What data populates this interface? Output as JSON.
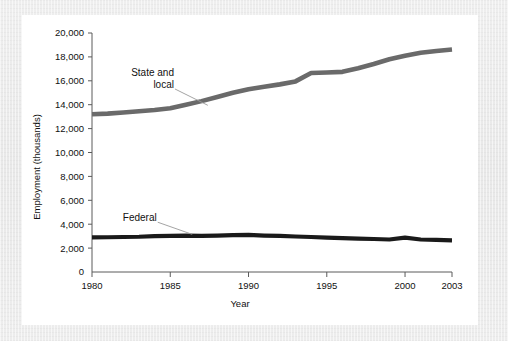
{
  "figure": {
    "background_color": "#ebebeb",
    "card_color": "#ffffff"
  },
  "chart_data": {
    "type": "line",
    "title": "",
    "xlabel": "Year",
    "ylabel": "Employment (thousands)",
    "xlim": [
      1980,
      2003
    ],
    "ylim": [
      0,
      20000
    ],
    "xticks": [
      "1980",
      "1985",
      "1990",
      "1995",
      "2000",
      "2003"
    ],
    "xtick_values": [
      1980,
      1985,
      1990,
      1995,
      2000,
      2003
    ],
    "yticks": [
      "0",
      "2,000",
      "4,000",
      "6,000",
      "8,000",
      "10,000",
      "12,000",
      "14,000",
      "16,000",
      "18,000",
      "20,000"
    ],
    "ytick_values": [
      0,
      2000,
      4000,
      6000,
      8000,
      10000,
      12000,
      14000,
      16000,
      18000,
      20000
    ],
    "grid": false,
    "legend": "inline-annotations",
    "x": [
      1980,
      1981,
      1982,
      1983,
      1984,
      1985,
      1986,
      1987,
      1988,
      1989,
      1990,
      1991,
      1992,
      1993,
      1994,
      1995,
      1996,
      1997,
      1998,
      1999,
      2000,
      2001,
      2002,
      2003
    ],
    "series": [
      {
        "name": "State and local",
        "color": "#6a6a6a",
        "line_width": 4.6,
        "values": [
          13200,
          13250,
          13350,
          13450,
          13550,
          13700,
          14000,
          14300,
          14650,
          15000,
          15300,
          15500,
          15700,
          15950,
          16650,
          16700,
          16750,
          17050,
          17400,
          17800,
          18100,
          18350,
          18500,
          18620
        ]
      },
      {
        "name": "Federal",
        "color": "#1a1a1a",
        "line_width": 4.2,
        "values": [
          2900,
          2910,
          2930,
          2950,
          3000,
          3020,
          3050,
          3030,
          3050,
          3080,
          3100,
          3050,
          3020,
          2970,
          2930,
          2880,
          2830,
          2790,
          2760,
          2720,
          2880,
          2720,
          2680,
          2650
        ]
      }
    ],
    "annotations": [
      {
        "name": "state-and-local-label",
        "text_lines": [
          "State and",
          "local"
        ],
        "leader_from_x": 1985.3,
        "leader_from_y": 15400,
        "leader_to_x": 1987.4,
        "leader_to_y": 13950
      },
      {
        "name": "federal-label",
        "text_lines": [
          "Federal"
        ],
        "leader_from_x": 1984.2,
        "leader_from_y": 4250,
        "leader_to_x": 1986.4,
        "leader_to_y": 3150
      }
    ]
  }
}
